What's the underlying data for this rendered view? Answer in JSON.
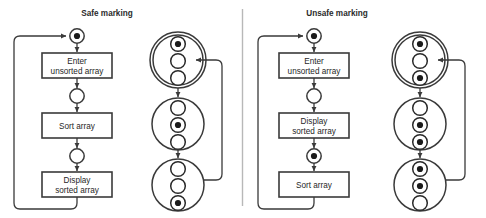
{
  "figure": {
    "type": "petri-net-reachability-diagram",
    "background": "#ffffff",
    "stroke_color": "#3a3a3a",
    "text_color": "#1f1f1f",
    "divider_color": "#b8b8b8"
  },
  "panels": [
    {
      "id": "safe",
      "title": "Safe marking",
      "net": {
        "places": [
          {
            "id": "p1",
            "tokens": 1
          },
          {
            "id": "p2",
            "tokens": 0
          },
          {
            "id": "p3",
            "tokens": 0
          }
        ],
        "transitions": [
          {
            "id": "t1",
            "label_line1": "Enter",
            "label_line2": "unsorted array"
          },
          {
            "id": "t2",
            "label_line1": "Sort array",
            "label_line2": ""
          },
          {
            "id": "t3",
            "label_line1": "Display",
            "label_line2": "sorted array"
          }
        ],
        "feedback_arc": true
      },
      "states": [
        {
          "id": "s1",
          "initial": true,
          "marking": [
            1,
            0,
            0
          ]
        },
        {
          "id": "s2",
          "initial": false,
          "marking": [
            0,
            1,
            0
          ]
        },
        {
          "id": "s3",
          "initial": false,
          "marking": [
            0,
            0,
            1
          ]
        }
      ],
      "state_feedback_arc": true
    },
    {
      "id": "unsafe",
      "title": "Unsafe marking",
      "net": {
        "places": [
          {
            "id": "p1",
            "tokens": 1
          },
          {
            "id": "p2",
            "tokens": 0
          },
          {
            "id": "p3",
            "tokens": 1
          }
        ],
        "transitions": [
          {
            "id": "t1",
            "label_line1": "Enter",
            "label_line2": "unsorted array"
          },
          {
            "id": "t2",
            "label_line1": "Display",
            "label_line2": "sorted array"
          },
          {
            "id": "t3",
            "label_line1": "Sort array",
            "label_line2": ""
          }
        ],
        "feedback_arc": true
      },
      "states": [
        {
          "id": "s1",
          "initial": true,
          "marking": [
            1,
            0,
            1
          ]
        },
        {
          "id": "s2",
          "initial": false,
          "marking": [
            0,
            1,
            1
          ]
        },
        {
          "id": "s3",
          "initial": false,
          "marking": [
            1,
            1,
            0
          ]
        }
      ],
      "state_feedback_arc": true
    }
  ]
}
